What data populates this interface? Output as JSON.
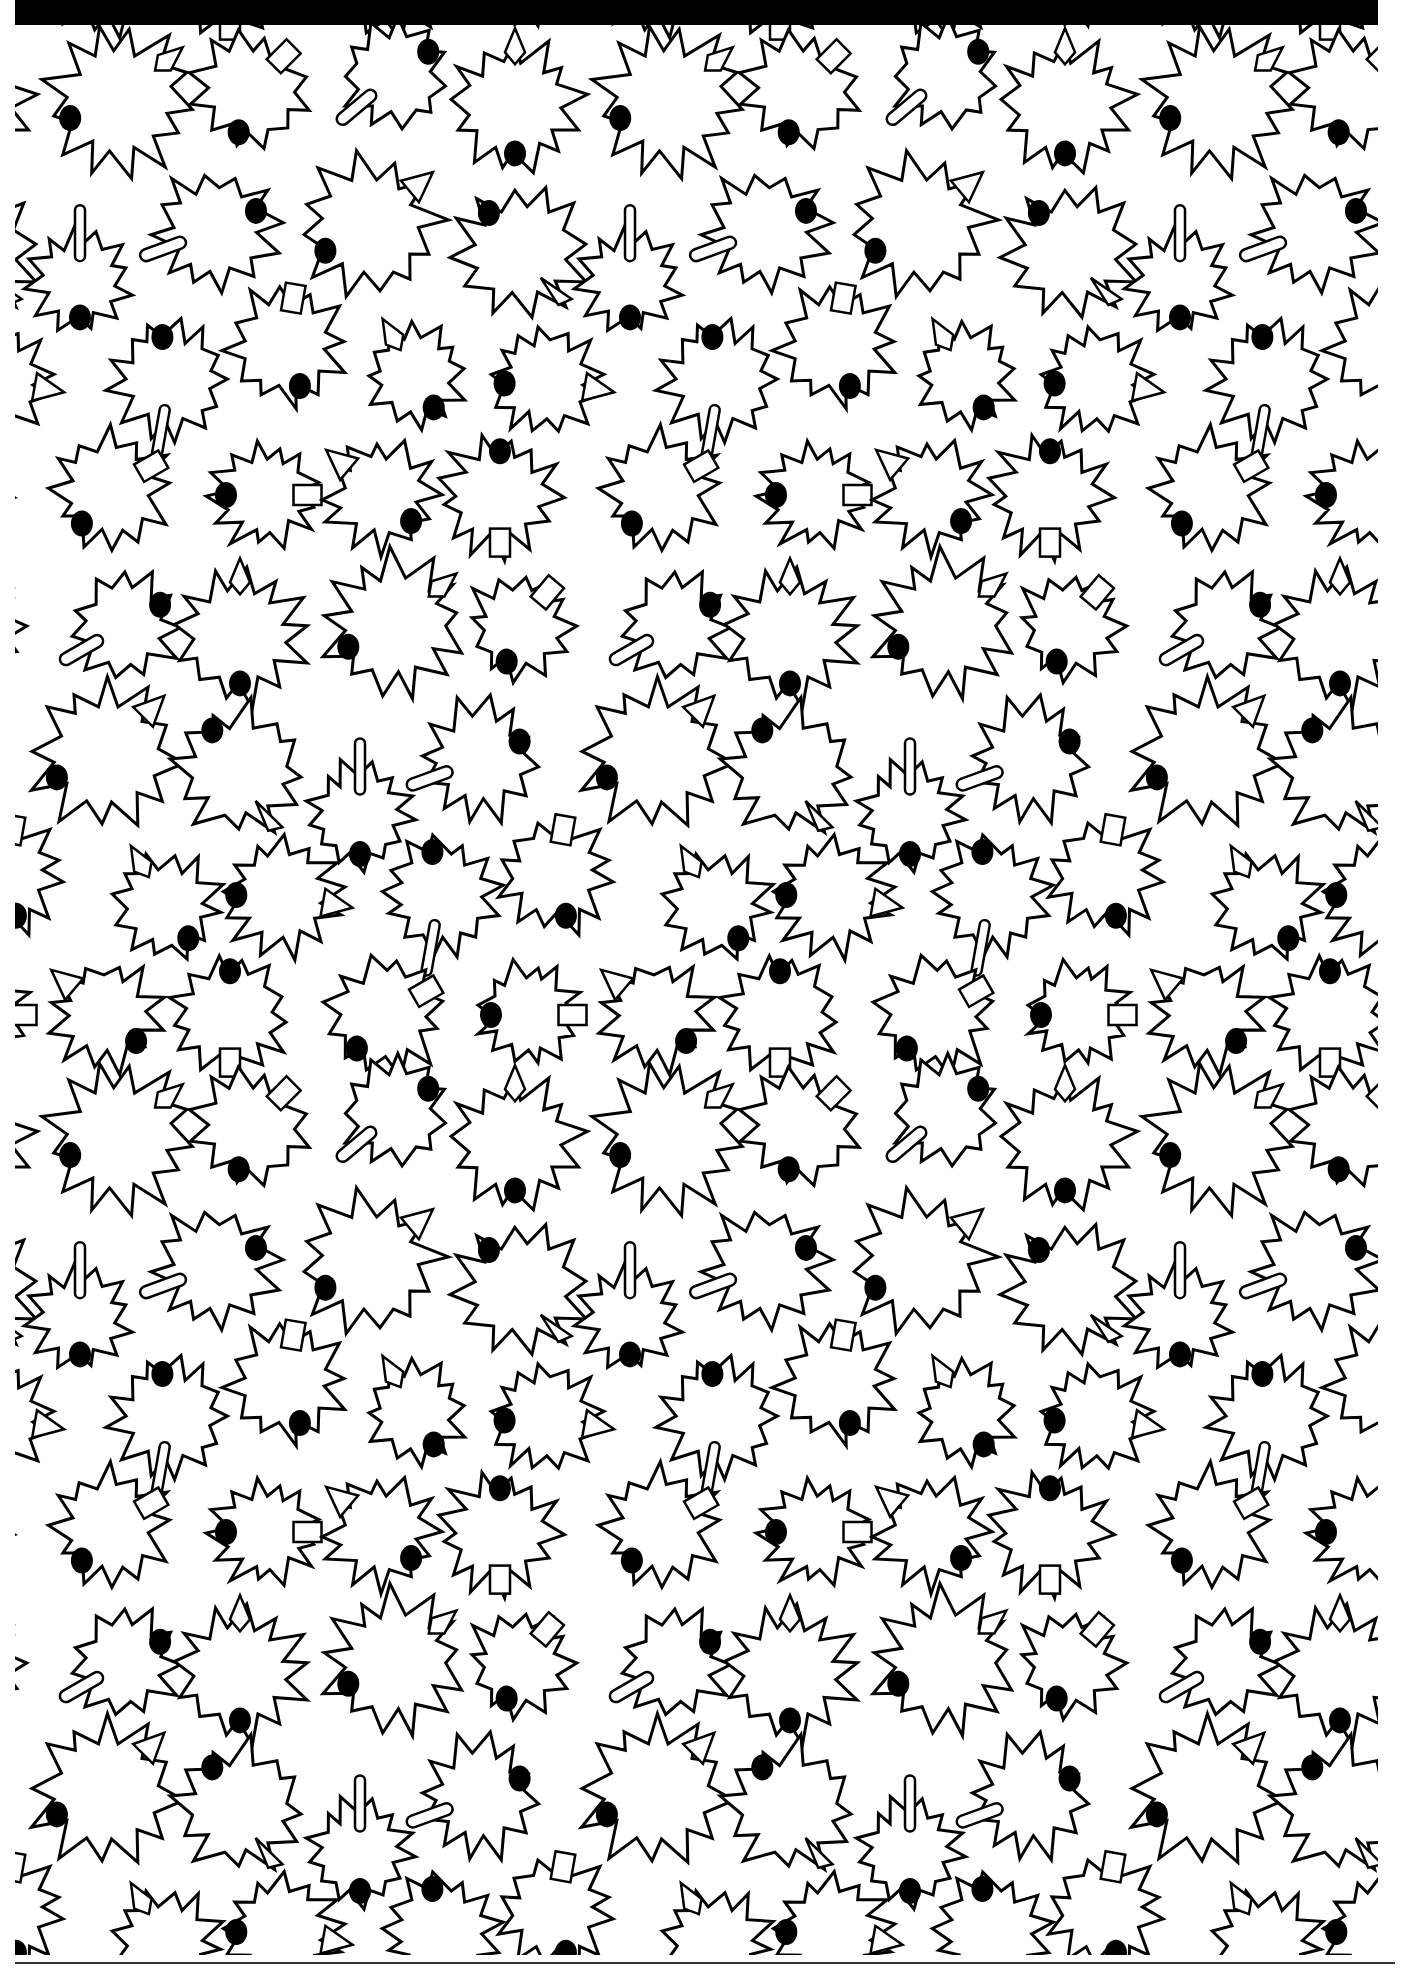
{
  "page": {
    "colors": {
      "ink": "#000000",
      "paper": "#ffffff",
      "rule": "#333333"
    }
  },
  "pattern": {
    "tile_width": 550,
    "tile_height": 1037,
    "offset_x": 0,
    "offset_y": 0,
    "stroke_width": 3,
    "leaves": [
      {
        "cx": 120,
        "cy": 75,
        "r": 68,
        "spikes": 13,
        "deco": "diamond",
        "deco_angle": -40,
        "dot_angle": 160,
        "seed": 1
      },
      {
        "cx": 250,
        "cy": 65,
        "r": 56,
        "spikes": 12,
        "deco": "rect",
        "deco_angle": -45,
        "dot_angle": 105,
        "seed": 2
      },
      {
        "cx": 395,
        "cy": 50,
        "r": 52,
        "spikes": 11,
        "deco": "bar",
        "deco_angle": 140,
        "dot_angle": -35,
        "seed": 3
      },
      {
        "cx": 515,
        "cy": 80,
        "r": 62,
        "spikes": 13,
        "deco": "diamond",
        "deco_angle": -90,
        "dot_angle": 90,
        "seed": 4
      },
      {
        "cx": 80,
        "cy": 255,
        "r": 48,
        "spikes": 12,
        "deco": "vbar",
        "deco_angle": -90,
        "dot_angle": 90,
        "seed": 5
      },
      {
        "cx": 215,
        "cy": 205,
        "r": 58,
        "spikes": 12,
        "deco": "bar",
        "deco_angle": 160,
        "dot_angle": -25,
        "seed": 6
      },
      {
        "cx": 370,
        "cy": 200,
        "r": 66,
        "spikes": 12,
        "deco": "triangle",
        "deco_angle": -40,
        "dot_angle": 150,
        "seed": 7
      },
      {
        "cx": 520,
        "cy": 225,
        "r": 62,
        "spikes": 12,
        "deco": "spike",
        "deco_angle": 50,
        "dot_angle": -130,
        "seed": 8
      },
      {
        "cx": 170,
        "cy": 355,
        "r": 56,
        "spikes": 13,
        "deco": "vbar",
        "deco_angle": 100,
        "dot_angle": -100,
        "seed": 9
      },
      {
        "cx": 285,
        "cy": 320,
        "r": 56,
        "spikes": 12,
        "deco": "rect",
        "deco_angle": -80,
        "dot_angle": 70,
        "seed": 10
      },
      {
        "cx": 415,
        "cy": 350,
        "r": 48,
        "spikes": 12,
        "deco": "diamond",
        "deco_angle": -120,
        "dot_angle": 60,
        "seed": 11
      },
      {
        "cx": 545,
        "cy": 355,
        "r": 52,
        "spikes": 13,
        "deco": "triangle",
        "deco_angle": 10,
        "dot_angle": 175,
        "seed": 12
      },
      {
        "cx": 110,
        "cy": 465,
        "r": 56,
        "spikes": 12,
        "deco": "rect",
        "deco_angle": -30,
        "dot_angle": 130,
        "seed": 13
      },
      {
        "cx": 265,
        "cy": 470,
        "r": 50,
        "spikes": 13,
        "deco": "rect",
        "deco_angle": 0,
        "dot_angle": 180,
        "seed": 14
      },
      {
        "cx": 380,
        "cy": 470,
        "r": 52,
        "spikes": 12,
        "deco": "triangle",
        "deco_angle": -140,
        "dot_angle": 40,
        "seed": 15
      },
      {
        "cx": 500,
        "cy": 470,
        "r": 56,
        "spikes": 13,
        "deco": "rect",
        "deco_angle": 90,
        "dot_angle": -90,
        "seed": 16
      },
      {
        "cx": 125,
        "cy": 600,
        "r": 52,
        "spikes": 11,
        "deco": "bar",
        "deco_angle": 150,
        "dot_angle": -30,
        "seed": 17
      },
      {
        "cx": 240,
        "cy": 610,
        "r": 62,
        "spikes": 13,
        "deco": "diamond",
        "deco_angle": -90,
        "dot_angle": 90,
        "seed": 18
      },
      {
        "cx": 395,
        "cy": 600,
        "r": 66,
        "spikes": 13,
        "deco": "diamond",
        "deco_angle": -40,
        "dot_angle": 155,
        "seed": 19
      },
      {
        "cx": 520,
        "cy": 600,
        "r": 50,
        "spikes": 12,
        "deco": "rect",
        "deco_angle": -50,
        "dot_angle": 110,
        "seed": 20
      },
      {
        "cx": 105,
        "cy": 730,
        "r": 68,
        "spikes": 12,
        "deco": "triangle",
        "deco_angle": -45,
        "dot_angle": 155,
        "seed": 21
      },
      {
        "cx": 240,
        "cy": 745,
        "r": 62,
        "spikes": 12,
        "deco": "spike",
        "deco_angle": 60,
        "dot_angle": -125,
        "seed": 22
      },
      {
        "cx": 360,
        "cy": 790,
        "r": 50,
        "spikes": 13,
        "deco": "vbar",
        "deco_angle": -90,
        "dot_angle": 90,
        "seed": 23
      },
      {
        "cx": 480,
        "cy": 735,
        "r": 56,
        "spikes": 12,
        "deco": "bar",
        "deco_angle": 160,
        "dot_angle": -25,
        "seed": 24
      },
      {
        "cx": 165,
        "cy": 880,
        "r": 52,
        "spikes": 12,
        "deco": "diamond",
        "deco_angle": -120,
        "dot_angle": 55,
        "seed": 25
      },
      {
        "cx": 280,
        "cy": 870,
        "r": 56,
        "spikes": 13,
        "deco": "triangle",
        "deco_angle": 10,
        "dot_angle": 180,
        "seed": 26
      },
      {
        "cx": 440,
        "cy": 870,
        "r": 56,
        "spikes": 13,
        "deco": "vbar",
        "deco_angle": 100,
        "dot_angle": -100,
        "seed": 27
      },
      {
        "cx": 555,
        "cy": 850,
        "r": 54,
        "spikes": 12,
        "deco": "rect",
        "deco_angle": -80,
        "dot_angle": 75,
        "seed": 28
      },
      {
        "cx": 105,
        "cy": 990,
        "r": 52,
        "spikes": 12,
        "deco": "triangle",
        "deco_angle": -140,
        "dot_angle": 40,
        "seed": 29
      },
      {
        "cx": 230,
        "cy": 990,
        "r": 56,
        "spikes": 13,
        "deco": "rect",
        "deco_angle": 90,
        "dot_angle": -90,
        "seed": 30
      },
      {
        "cx": 385,
        "cy": 990,
        "r": 56,
        "spikes": 12,
        "deco": "rect",
        "deco_angle": -30,
        "dot_angle": 130,
        "seed": 31
      },
      {
        "cx": 530,
        "cy": 990,
        "r": 50,
        "spikes": 13,
        "deco": "rect",
        "deco_angle": 0,
        "dot_angle": 180,
        "seed": 32
      }
    ]
  }
}
